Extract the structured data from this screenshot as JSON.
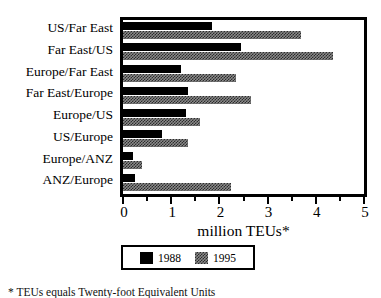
{
  "chart_data": {
    "type": "bar",
    "orientation": "horizontal",
    "title": "",
    "xlabel": "million TEUs*",
    "ylabel": "",
    "xlim": [
      0,
      5
    ],
    "xticks": [
      0,
      1,
      2,
      3,
      4,
      5
    ],
    "xtick_labels": [
      "0",
      "1",
      "2",
      "3",
      "4",
      "5"
    ],
    "minor_tick_interval": 0.5,
    "grid": false,
    "legend_position": "below-axis",
    "categories": [
      "US/Far East",
      "Far East/US",
      "Europe/Far East",
      "Far East/Europe",
      "Europe/US",
      "US/Europe",
      "Europe/ANZ",
      "ANZ/Europe"
    ],
    "series": [
      {
        "name": "1988",
        "color": "#000000",
        "fill": "solid-black",
        "values": [
          1.85,
          2.45,
          1.2,
          1.35,
          1.3,
          0.8,
          0.2,
          0.25
        ]
      },
      {
        "name": "1995",
        "color": "#8a8a8a",
        "fill": "checkered-gray",
        "values": [
          3.7,
          4.35,
          2.35,
          2.65,
          1.6,
          1.35,
          0.4,
          2.25
        ]
      }
    ]
  },
  "axis": {
    "label": "million TEUs*"
  },
  "legend": {
    "entries": [
      {
        "label": "1988",
        "swatch": "solid-black"
      },
      {
        "label": "1995",
        "swatch": "checkered-gray"
      }
    ]
  },
  "footnote": {
    "text": "* TEUs equals Twenty-foot Equivalent Units"
  }
}
